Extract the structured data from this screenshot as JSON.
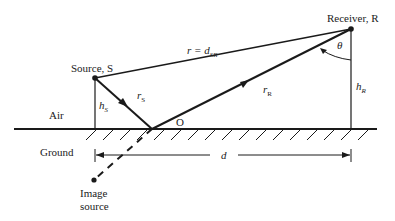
{
  "diagram": {
    "labels": {
      "source": "Source, S",
      "receiver": "Receiver, R",
      "direct_path_r": "r = ",
      "direct_path_d": "d",
      "direct_path_sub": "SR",
      "rs_main": "r",
      "rs_sub": "S",
      "rr_main": "r",
      "rr_sub": "R",
      "hs_main": "h",
      "hs_sub": "S",
      "hr_main": "h",
      "hr_sub": "R",
      "theta": "θ",
      "reflection_point": "O",
      "air": "Air",
      "ground": "Ground",
      "distance": "d",
      "image_source_line1": "Image",
      "image_source_line2": "source"
    },
    "colors": {
      "stroke": "#1a1a1a",
      "background": "#ffffff"
    }
  }
}
